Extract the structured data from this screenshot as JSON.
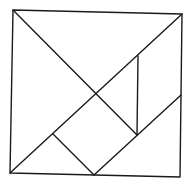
{
  "diagram": {
    "colors": {
      "line": "#1a1a1a",
      "background": "#ffffff"
    },
    "pieces": [
      {
        "name": "large-triangle-top",
        "type": "triangle"
      },
      {
        "name": "large-triangle-left",
        "type": "triangle"
      },
      {
        "name": "medium-triangle-bottom-right",
        "type": "triangle"
      },
      {
        "name": "small-triangle-right",
        "type": "triangle"
      },
      {
        "name": "small-triangle-bottom-left",
        "type": "triangle"
      },
      {
        "name": "square-center",
        "type": "square"
      },
      {
        "name": "parallelogram-bottom",
        "type": "parallelogram"
      }
    ]
  }
}
